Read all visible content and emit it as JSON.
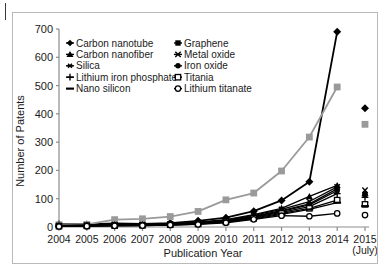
{
  "chart_data": {
    "type": "line",
    "title": "",
    "xlabel": "Publication Year",
    "ylabel": "Number  of  Patents",
    "x_tick_sublabel": "(July)",
    "categories": [
      "2004",
      "2005",
      "2006",
      "2007",
      "2008",
      "2009",
      "2010",
      "2011",
      "2012",
      "2013",
      "2014",
      "2015"
    ],
    "xlim": [
      2004,
      2015
    ],
    "ylim": [
      0,
      700
    ],
    "yticks": [
      0,
      100,
      200,
      300,
      400,
      500,
      600,
      700
    ],
    "grid": false,
    "legend_position": "top-left-inside",
    "note": "2015 values are partial-year (July) and are drawn as isolated markers with no connecting line",
    "series": [
      {
        "name": "Carbon nanotube",
        "marker": "filled-diamond",
        "color": "#000000",
        "values": [
          10,
          9,
          13,
          11,
          14,
          22,
          33,
          56,
          94,
          160,
          690,
          420
        ]
      },
      {
        "name": "Graphene",
        "marker": "filled-square",
        "color": "#9a9a9a",
        "values": [
          8,
          9,
          26,
          29,
          37,
          55,
          96,
          120,
          198,
          318,
          495,
          363
        ]
      },
      {
        "name": "Carbon nanofiber",
        "marker": "filled-triangle",
        "color": "#000000",
        "values": [
          6,
          7,
          9,
          9,
          12,
          17,
          26,
          44,
          66,
          108,
          147,
          120
        ]
      },
      {
        "name": "Metal oxide",
        "marker": "cross-x",
        "color": "#000000",
        "values": [
          5,
          6,
          8,
          8,
          11,
          15,
          24,
          41,
          62,
          90,
          142,
          130
        ]
      },
      {
        "name": "Silica",
        "marker": "asterisk",
        "color": "#000000",
        "values": [
          5,
          5,
          7,
          7,
          10,
          14,
          22,
          38,
          58,
          82,
          135,
          118
        ]
      },
      {
        "name": "Iron oxide",
        "marker": "filled-circle",
        "color": "#000000",
        "values": [
          4,
          5,
          6,
          7,
          9,
          13,
          21,
          36,
          55,
          78,
          128,
          112
        ]
      },
      {
        "name": "Lithium iron phosphate",
        "marker": "plus",
        "color": "#000000",
        "values": [
          4,
          4,
          6,
          6,
          9,
          12,
          20,
          34,
          52,
          72,
          118,
          105
        ]
      },
      {
        "name": "Titania",
        "marker": "open-square",
        "color": "#000000",
        "values": [
          3,
          4,
          5,
          6,
          8,
          11,
          18,
          31,
          48,
          66,
          95,
          80
        ]
      },
      {
        "name": "Nano silicon",
        "marker": "dash",
        "color": "#000000",
        "values": [
          3,
          3,
          5,
          5,
          7,
          10,
          17,
          29,
          45,
          62,
          86,
          74
        ]
      },
      {
        "name": "Lithium titanate",
        "marker": "open-circle",
        "color": "#000000",
        "values": [
          2,
          3,
          4,
          5,
          7,
          9,
          15,
          27,
          40,
          38,
          48,
          42
        ]
      }
    ],
    "legend": [
      {
        "label": "Carbon nanotube",
        "marker": "filled-diamond",
        "column": 0
      },
      {
        "label": "Carbon nanofiber",
        "marker": "filled-triangle",
        "column": 0
      },
      {
        "label": "Silica",
        "marker": "asterisk",
        "column": 0
      },
      {
        "label": "Lithium iron phosphate",
        "marker": "plus",
        "column": 0
      },
      {
        "label": "Nano silicon",
        "marker": "dash",
        "column": 0
      },
      {
        "label": "Graphene",
        "marker": "filled-square",
        "column": 1
      },
      {
        "label": "Metal oxide",
        "marker": "cross-x",
        "column": 1
      },
      {
        "label": "Iron oxide",
        "marker": "filled-circle",
        "column": 1
      },
      {
        "label": "Titania",
        "marker": "open-square",
        "column": 1
      },
      {
        "label": "Lithium titanate",
        "marker": "open-circle",
        "column": 1
      }
    ],
    "colors": {
      "axis": "#8c8c8c",
      "text": "#1a1a1a",
      "frame": "#b9b9b9",
      "graphene_line": "#9a9a9a",
      "default_line": "#000000"
    }
  }
}
